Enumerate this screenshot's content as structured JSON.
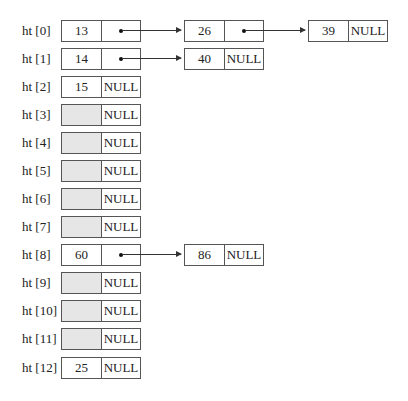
{
  "diagram": {
    "type": "hash table with chaining",
    "null_label": "NULL",
    "colors": {
      "border": "#555555",
      "empty_fill": "#e6e6e6",
      "text": "#222222"
    },
    "rows": [
      {
        "label": "ht [0]",
        "chain": [
          {
            "key": "13"
          },
          {
            "key": "26"
          },
          {
            "key": "39"
          }
        ]
      },
      {
        "label": "ht [1]",
        "chain": [
          {
            "key": "14"
          },
          {
            "key": "40"
          }
        ]
      },
      {
        "label": "ht [2]",
        "chain": [
          {
            "key": "15"
          }
        ]
      },
      {
        "label": "ht [3]",
        "chain": [
          {
            "key": ""
          }
        ]
      },
      {
        "label": "ht [4]",
        "chain": [
          {
            "key": ""
          }
        ]
      },
      {
        "label": "ht [5]",
        "chain": [
          {
            "key": ""
          }
        ]
      },
      {
        "label": "ht [6]",
        "chain": [
          {
            "key": ""
          }
        ]
      },
      {
        "label": "ht [7]",
        "chain": [
          {
            "key": ""
          }
        ]
      },
      {
        "label": "ht [8]",
        "chain": [
          {
            "key": "60"
          },
          {
            "key": "86"
          }
        ]
      },
      {
        "label": "ht [9]",
        "chain": [
          {
            "key": ""
          }
        ]
      },
      {
        "label": "ht [10]",
        "chain": [
          {
            "key": ""
          }
        ]
      },
      {
        "label": "ht [11]",
        "chain": [
          {
            "key": ""
          }
        ]
      },
      {
        "label": "ht [12]",
        "chain": [
          {
            "key": "25"
          }
        ]
      }
    ]
  }
}
